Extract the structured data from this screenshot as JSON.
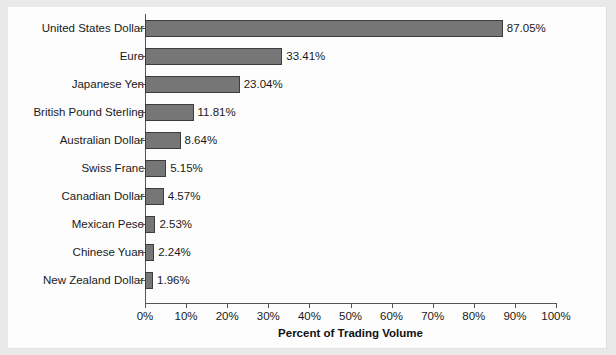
{
  "chart_data": {
    "type": "bar",
    "orientation": "horizontal",
    "title": "",
    "xlabel": "Percent of Trading Volume",
    "ylabel": "",
    "xlim": [
      0,
      100
    ],
    "xtick_labels": [
      "0%",
      "10%",
      "20%",
      "30%",
      "40%",
      "50%",
      "60%",
      "70%",
      "80%",
      "90%",
      "100%"
    ],
    "xtick_values": [
      0,
      10,
      20,
      30,
      40,
      50,
      60,
      70,
      80,
      90,
      100
    ],
    "grid": false,
    "legend": false,
    "categories": [
      "United States Dollar",
      "Euro",
      "Japanese Yen",
      "British Pound Sterling",
      "Australian Dollar",
      "Swiss Franc",
      "Canadian Dollar",
      "Mexican Peso",
      "Chinese Yuan",
      "New Zealand Dollar"
    ],
    "values": [
      87.05,
      33.41,
      23.04,
      11.81,
      8.64,
      5.15,
      4.57,
      2.53,
      2.24,
      1.96
    ],
    "data_labels": [
      "87.05%",
      "33.41%",
      "23.04%",
      "11.81%",
      "8.64%",
      "5.15%",
      "4.57%",
      "2.53%",
      "2.24%",
      "1.96%"
    ],
    "bar_color": "#767676",
    "bar_border_color": "#3d3d3d",
    "axis_color": "#555555",
    "text_color": "#1a1a1a",
    "background_color": "#fdfdfd"
  }
}
